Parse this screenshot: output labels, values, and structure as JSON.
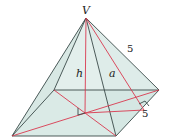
{
  "figure": {
    "apex_label": "V",
    "height_label": "h",
    "slant_height_label": "a",
    "lateral_edge_label": "5",
    "base_edge_label": "5",
    "colors": {
      "face_fill": "#d6e8e3",
      "face_fill_dark": "#c6ddd7",
      "edge": "#3a4a48",
      "construction": "#d9394f"
    }
  }
}
